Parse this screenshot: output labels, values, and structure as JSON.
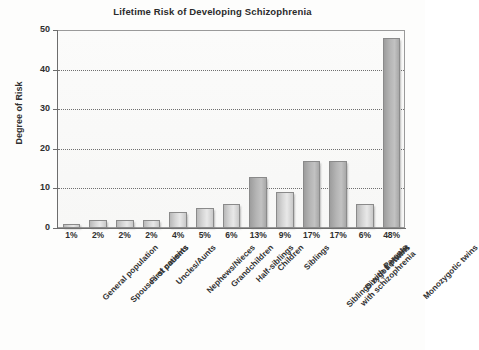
{
  "chart_data": {
    "type": "bar",
    "title": "Lifetime Risk of Developing Schizophrenia",
    "xlabel": "",
    "ylabel": "Degree of Risk",
    "ylim": [
      0,
      50
    ],
    "yticks": [
      0,
      10,
      20,
      30,
      40,
      50
    ],
    "grid": true,
    "legend": "none",
    "categories": [
      "General population",
      "Spouses of patients",
      "First cousins",
      "Uncles/Aunts",
      "Nephews/Nieces",
      "Grandchildren",
      "Half-siblings",
      "Children",
      "Siblings",
      "Siblings with 1 parent\nwith schizophrenia",
      "Dizygotic twins",
      "Parents",
      "Monozygotic twins"
    ],
    "values": [
      1,
      2,
      2,
      2,
      4,
      5,
      6,
      13,
      9,
      17,
      17,
      6,
      48
    ],
    "value_labels": [
      "1%",
      "2%",
      "2%",
      "2%",
      "4%",
      "5%",
      "6%",
      "13%",
      "9%",
      "17%",
      "17%",
      "6%",
      "48%"
    ],
    "colors": {
      "bar_fill_light": "#d6d6d6",
      "bar_fill_dark": "#b5b5b5",
      "bar_border": "#8a8a8a",
      "grid": "#6f6f6f",
      "axis": "#6d6d6d",
      "text": "#2f2f2f",
      "background": "#fdfdfc"
    }
  }
}
